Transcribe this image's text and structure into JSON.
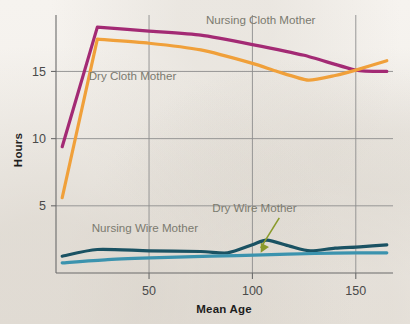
{
  "figure": {
    "background_color": "#f4f1ec",
    "plot_area": {
      "left": 56,
      "top": 15,
      "right": 393,
      "bottom": 273
    }
  },
  "chart_data": {
    "type": "line",
    "title": "",
    "subtitle": "",
    "xlabel": "Mean Age",
    "ylabel": "Hours",
    "xlim": [
      5,
      168
    ],
    "ylim": [
      0,
      19.2
    ],
    "xticks": [
      50,
      100,
      150
    ],
    "xticklabels": [
      "50",
      "100",
      "150"
    ],
    "yticks": [
      5,
      10,
      15
    ],
    "yticklabels": [
      "5",
      "10",
      "15"
    ],
    "grid": "horizontal-and-vertical-at-ticks",
    "legend_position": "inline-labels",
    "series": [
      {
        "name": "Nursing Cloth Mother",
        "color": "#a32a74",
        "line_width": 3.2,
        "label": "Nursing Cloth Mother",
        "label_x": 104,
        "label_y": 18.55,
        "x": [
          8,
          25,
          50,
          75,
          100,
          125,
          150,
          165
        ],
        "values": [
          9.4,
          18.3,
          18.0,
          17.7,
          17.0,
          16.2,
          15.1,
          15.0
        ]
      },
      {
        "name": "Dry Cloth Mother",
        "color": "#f0a03a",
        "line_width": 3.2,
        "label": "Dry Cloth Mother",
        "label_x": 42,
        "label_y": 14.35,
        "x": [
          8,
          25,
          50,
          75,
          100,
          112,
          127,
          140,
          150,
          165
        ],
        "values": [
          5.6,
          17.4,
          17.1,
          16.6,
          15.6,
          15.0,
          14.35,
          14.7,
          15.1,
          15.8
        ]
      },
      {
        "name": "Nursing Wire Mother",
        "color": "#1a5263",
        "line_width": 3.2,
        "label": "Nursing Wire Mother",
        "label_x": 48,
        "label_y": 3.05,
        "x": [
          8,
          25,
          50,
          75,
          88,
          100,
          107,
          118,
          128,
          140,
          152,
          165
        ],
        "values": [
          1.25,
          1.75,
          1.65,
          1.6,
          1.5,
          2.1,
          2.45,
          2.0,
          1.65,
          1.85,
          1.95,
          2.1
        ]
      },
      {
        "name": "Dry Wire Mother",
        "color": "#3b93ae",
        "line_width": 3.2,
        "label": "Dry Wire Mother",
        "label_x": 101,
        "label_y": 4.55,
        "x": [
          8,
          30,
          55,
          80,
          105,
          130,
          150,
          165
        ],
        "values": [
          0.75,
          1.0,
          1.15,
          1.25,
          1.35,
          1.45,
          1.5,
          1.5
        ]
      }
    ],
    "annotations": [
      {
        "text": "Dry Wire Mother",
        "target_series": "Dry Wire Mother",
        "arrow_color": "#8a9a2b",
        "arrow_from_x": 113,
        "arrow_from_y": 4.1,
        "arrow_to_x": 104,
        "arrow_to_y": 1.5
      }
    ]
  }
}
